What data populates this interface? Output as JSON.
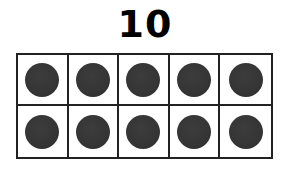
{
  "title": "10",
  "ten_frame": {
    "rows": 2,
    "columns": 5,
    "filled_count": 10,
    "cells": [
      {
        "filled": true
      },
      {
        "filled": true
      },
      {
        "filled": true
      },
      {
        "filled": true
      },
      {
        "filled": true
      },
      {
        "filled": true
      },
      {
        "filled": true
      },
      {
        "filled": true
      },
      {
        "filled": true
      },
      {
        "filled": true
      }
    ],
    "counter_color": "#353535",
    "border_color": "#222222"
  }
}
